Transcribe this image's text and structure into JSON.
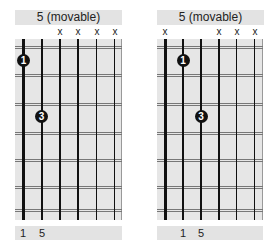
{
  "diagrams": [
    {
      "title": "5 (movable)",
      "strings_x": [
        23,
        42,
        60,
        78,
        97,
        115
      ],
      "muted_markers": [
        {
          "string": 3,
          "label": "x"
        },
        {
          "string": 4,
          "label": "x"
        },
        {
          "string": 5,
          "label": "x"
        },
        {
          "string": 6,
          "label": "x"
        }
      ],
      "finger_dots": [
        {
          "string": 1,
          "fret": 1,
          "label": "1"
        },
        {
          "string": 2,
          "fret": 3,
          "label": "3"
        }
      ],
      "footer_labels": [
        {
          "string": 1,
          "label": "1"
        },
        {
          "string": 2,
          "label": "5"
        }
      ]
    },
    {
      "title": "5 (movable)",
      "strings_x": [
        165,
        183,
        201,
        219,
        237,
        255
      ],
      "muted_markers": [
        {
          "string": 1,
          "label": "x"
        },
        {
          "string": 4,
          "label": "x"
        },
        {
          "string": 5,
          "label": "x"
        },
        {
          "string": 6,
          "label": "x"
        }
      ],
      "finger_dots": [
        {
          "string": 2,
          "fret": 1,
          "label": "1"
        },
        {
          "string": 3,
          "fret": 3,
          "label": "3"
        }
      ],
      "footer_labels": [
        {
          "string": 2,
          "label": "1"
        },
        {
          "string": 3,
          "label": "5"
        }
      ]
    }
  ],
  "colors": {
    "grid_background": "#e6e6e6",
    "header_footer_background": "#e3e3e3",
    "string_color": "#111111",
    "fret_color": "#777777",
    "dot_color": "#111111"
  }
}
